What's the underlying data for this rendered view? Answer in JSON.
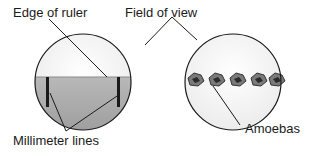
{
  "diagram": {
    "labels": {
      "edge_of_ruler": "Edge of ruler",
      "field_of_view": "Field of view",
      "millimeter_lines": "Millimeter lines",
      "amoebas": "Amoebas"
    },
    "left_view": {
      "description": "Field of view showing ruler with millimeter lines",
      "millimeter_line_count": 2
    },
    "right_view": {
      "description": "Field of view showing a row of amoebas",
      "amoeba_count": 5
    },
    "colors": {
      "outline": "#1a1a1a",
      "ruler_fill": "#a9a9a9",
      "field_fill": "#f4f4f4",
      "amoeba_fill": "#6e6e6e"
    }
  }
}
